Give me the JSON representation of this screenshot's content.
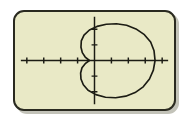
{
  "screen": {
    "label": "graphing-calculator-screen",
    "background_color": "#e9e9c6",
    "border_color": "#2a2a20",
    "ink_color": "#1c1c14",
    "outside_color": "#ffffff",
    "shadow_color": "#b9b9ad"
  },
  "chart_data": {
    "type": "line",
    "title": "",
    "subtitle": "",
    "xlabel": "",
    "ylabel": "",
    "grid": false,
    "legend": null,
    "legend_position": "none",
    "axes": {
      "x_axis_visible": true,
      "y_axis_visible": true,
      "x_axis_screen_y": 62,
      "y_axis_screen_x": 59,
      "tick_spacing_px": 18,
      "x_tick_positions_px": [
        23,
        41,
        59,
        77,
        95,
        113,
        131,
        149,
        167
      ],
      "y_tick_positions_px": [
        26,
        44,
        62,
        80,
        98
      ],
      "xlim": [
        -4.7,
        4.7
      ],
      "ylim": [
        -3.1,
        3.1
      ],
      "x_ticks": [
        -4,
        -3,
        -2,
        -1,
        0,
        1,
        2,
        3,
        4
      ],
      "y_ticks": [
        -2,
        -1,
        0,
        1,
        2
      ],
      "tick_labels_shown": false
    },
    "series": [
      {
        "name": "cardioid",
        "equation": "r = a(1 + cos(theta))",
        "closed": true,
        "description": "closed cardioid-like curve with a cusp at the left near the origin, opening to the right",
        "points": [
          [
            -0.3,
            0.0
          ],
          [
            -0.55,
            0.22
          ],
          [
            -0.72,
            0.5
          ],
          [
            -0.8,
            0.85
          ],
          [
            -0.78,
            1.25
          ],
          [
            -0.62,
            1.62
          ],
          [
            -0.3,
            1.95
          ],
          [
            0.15,
            2.18
          ],
          [
            0.7,
            2.32
          ],
          [
            1.3,
            2.35
          ],
          [
            1.9,
            2.25
          ],
          [
            2.45,
            2.02
          ],
          [
            2.95,
            1.65
          ],
          [
            3.32,
            1.18
          ],
          [
            3.52,
            0.62
          ],
          [
            3.58,
            0.0
          ],
          [
            3.48,
            -0.62
          ],
          [
            3.25,
            -1.18
          ],
          [
            2.88,
            -1.68
          ],
          [
            2.4,
            -2.05
          ],
          [
            1.85,
            -2.28
          ],
          [
            1.25,
            -2.38
          ],
          [
            0.65,
            -2.35
          ],
          [
            0.08,
            -2.18
          ],
          [
            -0.38,
            -1.9
          ],
          [
            -0.66,
            -1.55
          ],
          [
            -0.8,
            -1.18
          ],
          [
            -0.82,
            -0.8
          ],
          [
            -0.74,
            -0.46
          ],
          [
            -0.55,
            -0.2
          ],
          [
            -0.3,
            0.0
          ]
        ]
      }
    ]
  }
}
